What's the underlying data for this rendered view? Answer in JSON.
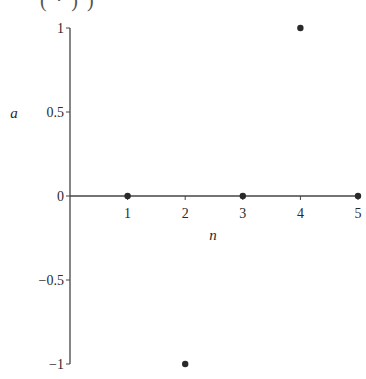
{
  "header": {
    "partial_text": "(  ·  )    )"
  },
  "chart_data": {
    "type": "scatter",
    "title": "",
    "xlabel": "n",
    "ylabel": "a",
    "x": [
      1,
      2,
      3,
      4,
      5
    ],
    "series": [
      {
        "name": "a",
        "values": [
          0,
          -1,
          0,
          1,
          0
        ]
      }
    ],
    "x_ticks": [
      "1",
      "2",
      "3",
      "4",
      "5"
    ],
    "y_ticks": [
      "1",
      "0.5",
      "0",
      "−0.5",
      "−1"
    ],
    "xlim": [
      0,
      5
    ],
    "ylim": [
      -1,
      1
    ],
    "grid": false,
    "legend": "none",
    "point_color": "#2a2a2a"
  }
}
